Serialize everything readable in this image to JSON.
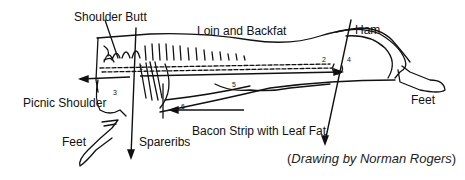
{
  "diagram": {
    "labels": {
      "shoulder_butt": "Shoulder Butt",
      "loin_backfat": "Loin and Backfat",
      "ham": "Ham",
      "picnic_shoulder": "Picnic Shoulder",
      "feet_front": "Feet",
      "feet_rear": "Feet",
      "spareribs": "Spareribs",
      "bacon_strip": "Bacon Strip with Leaf Fat"
    },
    "numbers": [
      "1",
      "2",
      "3",
      "4",
      "5",
      "6"
    ],
    "credit": {
      "open": "(",
      "drawing_by": "Drawing by Norman Rogers",
      "close": ")"
    }
  }
}
